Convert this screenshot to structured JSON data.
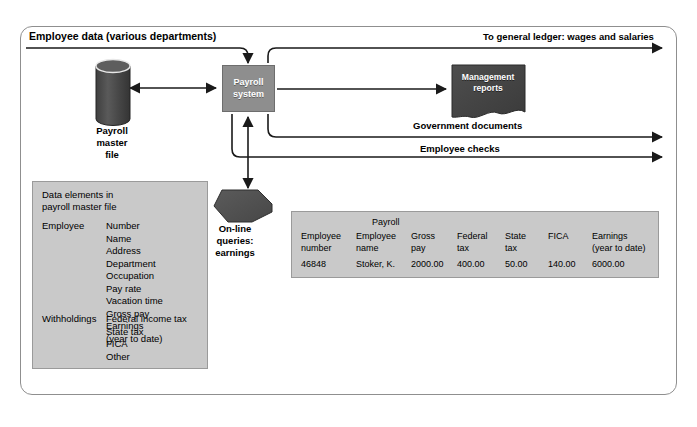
{
  "diagram": {
    "header_label": "Employee data (various departments)",
    "nodes": {
      "payroll_system": "Payroll\nsystem",
      "payroll_master_file": "Payroll\nmaster\nfile",
      "online_queries": "On-line\nqueries:\nearnings",
      "management_reports": "Management\nreports"
    },
    "flows": {
      "general_ledger": "To general ledger: wages and salaries",
      "government_documents": "Government documents",
      "employee_checks": "Employee checks"
    },
    "colors": {
      "panel_fill": "#c9c9c9",
      "process_fill": "#8e8e8e",
      "store_fill": "#4a4a4a",
      "line": "#1a1a1a",
      "frame_border": "#8f8f8f"
    }
  },
  "data_panel": {
    "title": "Data elements in\npayroll master file",
    "groups": [
      {
        "category": "Employee",
        "items": "Number\nName\nAddress\nDepartment\nOccupation\nPay rate\nVacation time\nGross pay\nEarnings\n(year to date)"
      },
      {
        "category": "Withholdings",
        "items": "Federal income tax\nState tax\nFICA\nOther"
      }
    ]
  },
  "payroll_table": {
    "supertitle": "Payroll",
    "columns": [
      "Employee\nnumber",
      "Employee\nname",
      "Gross\npay",
      "Federal\ntax",
      "State\ntax",
      "FICA",
      "Earnings\n(year to date)"
    ],
    "row": [
      "46848",
      "Stoker, K.",
      "2000.00",
      "400.00",
      "50.00",
      "140.00",
      "6000.00"
    ]
  }
}
